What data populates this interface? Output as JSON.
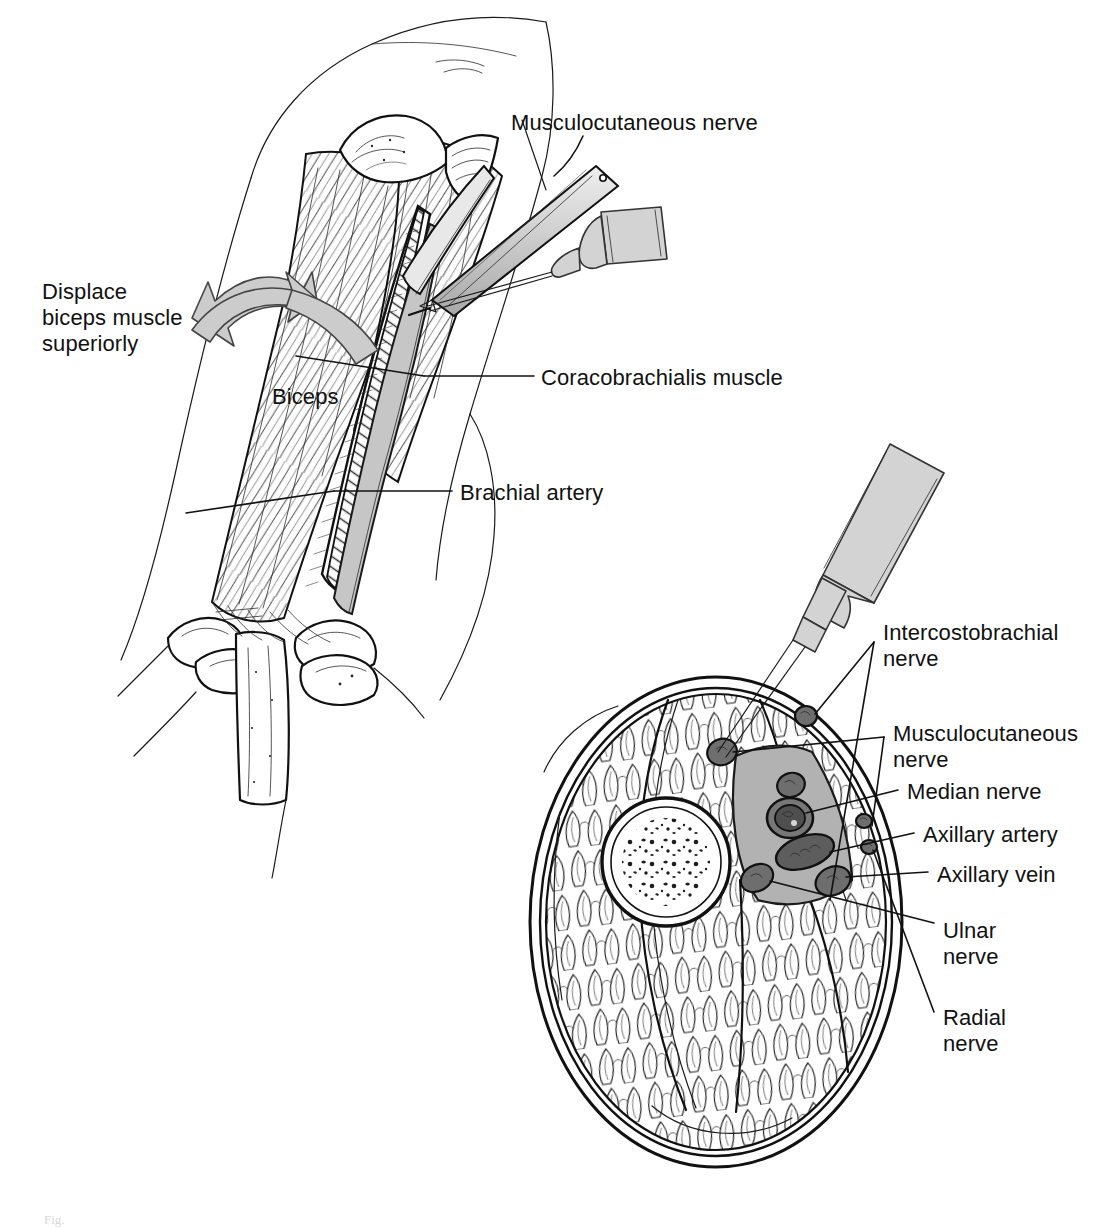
{
  "figure": {
    "caption_fragment": "Fig.",
    "background_color": "#ffffff",
    "ink_color": "#111111",
    "bundle_fill_color": "#b2b2b2",
    "instrument_fill_color": "#d3d3d3",
    "arrow_fill_color": "#cccccc"
  },
  "panels": [
    {
      "id": "upper-panel",
      "name": "surgical-exposure-view",
      "description": "Oblique view of the upper arm with biceps retracted superiorly, needle and syringe entering the neurovascular groove"
    },
    {
      "id": "lower-panel",
      "name": "cross-section-view",
      "description": "Axial cross-section of the upper arm showing humerus, muscle compartments and the axillary neurovascular bundle with needle in place"
    }
  ],
  "labels": {
    "upper": [
      {
        "key": "musculocutaneous_nerve",
        "text": "Musculocutaneous nerve",
        "x": 511,
        "y": 110,
        "align": "left"
      },
      {
        "key": "displace_biceps",
        "text": "Displace\nbiceps muscle\nsuperiorly",
        "x": 42,
        "y": 279,
        "align": "left"
      },
      {
        "key": "biceps",
        "text": "Biceps",
        "x": 272,
        "y": 384,
        "align": "left"
      },
      {
        "key": "coracobrachialis_muscle",
        "text": "Coracobrachialis muscle",
        "x": 541,
        "y": 365,
        "align": "left"
      },
      {
        "key": "brachial_artery",
        "text": "Brachial artery",
        "x": 460,
        "y": 480,
        "align": "left"
      }
    ],
    "lower": [
      {
        "key": "intercostobrachial_nerve",
        "text": "Intercostobrachial\nnerve",
        "x": 883,
        "y": 620,
        "align": "left"
      },
      {
        "key": "musculocutaneous_nerve",
        "text": "Musculocutaneous\nnerve",
        "x": 893,
        "y": 721,
        "align": "left"
      },
      {
        "key": "median_nerve",
        "text": "Median nerve",
        "x": 907,
        "y": 779,
        "align": "left"
      },
      {
        "key": "axillary_artery",
        "text": "Axillary artery",
        "x": 923,
        "y": 822,
        "align": "left"
      },
      {
        "key": "axillary_vein",
        "text": "Axillary vein",
        "x": 937,
        "y": 862,
        "align": "left"
      },
      {
        "key": "ulnar_nerve",
        "text": "Ulnar\nnerve",
        "x": 943,
        "y": 918,
        "align": "left"
      },
      {
        "key": "radial_nerve",
        "text": "Radial\nnerve",
        "x": 943,
        "y": 1005,
        "align": "left"
      }
    ]
  },
  "structures": {
    "cross_section": [
      "humerus",
      "biceps-compartment",
      "coracobrachialis-compartment",
      "triceps-compartment",
      "brachialis-compartment",
      "neurovascular-bundle-sheath"
    ],
    "instruments": [
      "syringe-upper",
      "needle-upper",
      "retractor-upper",
      "syringe-lower",
      "needle-lower"
    ]
  }
}
